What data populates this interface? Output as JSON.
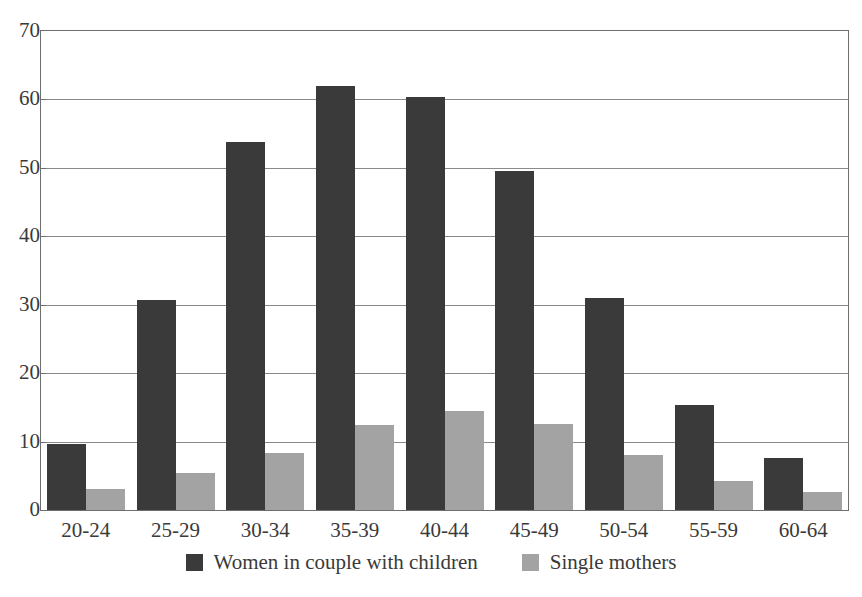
{
  "chart_data": {
    "type": "bar",
    "title": "",
    "subtitle": "",
    "xlabel": "",
    "ylabel": "",
    "ylim": [
      0,
      70
    ],
    "y_ticks": [
      0,
      10,
      20,
      30,
      40,
      50,
      60,
      70
    ],
    "grid": true,
    "grid_axis": "y",
    "legend_position": "bottom",
    "categories": [
      "20-24",
      "25-29",
      "30-34",
      "35-39",
      "40-44",
      "45-49",
      "50-54",
      "55-59",
      "60-64"
    ],
    "series": [
      {
        "name": "Women in couple with children",
        "color": "#3a3a3a",
        "values": [
          9.7,
          30.7,
          53.8,
          62.0,
          60.4,
          49.6,
          31.0,
          15.3,
          7.6
        ]
      },
      {
        "name": "Single mothers",
        "color": "#a3a3a3",
        "values": [
          3.1,
          5.4,
          8.4,
          12.4,
          14.5,
          12.5,
          8.0,
          4.2,
          2.6
        ]
      }
    ]
  },
  "axes": {
    "y_tick_labels": [
      "0",
      "10",
      "20",
      "30",
      "40",
      "50",
      "60",
      "70"
    ],
    "x_tick_labels": [
      "20-24",
      "25-29",
      "30-34",
      "35-39",
      "40-44",
      "45-49",
      "50-54",
      "55-59",
      "60-64"
    ]
  },
  "legend": {
    "items": [
      {
        "label": "Women in couple with children",
        "swatch": "dark-square-swatch"
      },
      {
        "label": "Single mothers",
        "swatch": "light-square-swatch"
      }
    ]
  }
}
